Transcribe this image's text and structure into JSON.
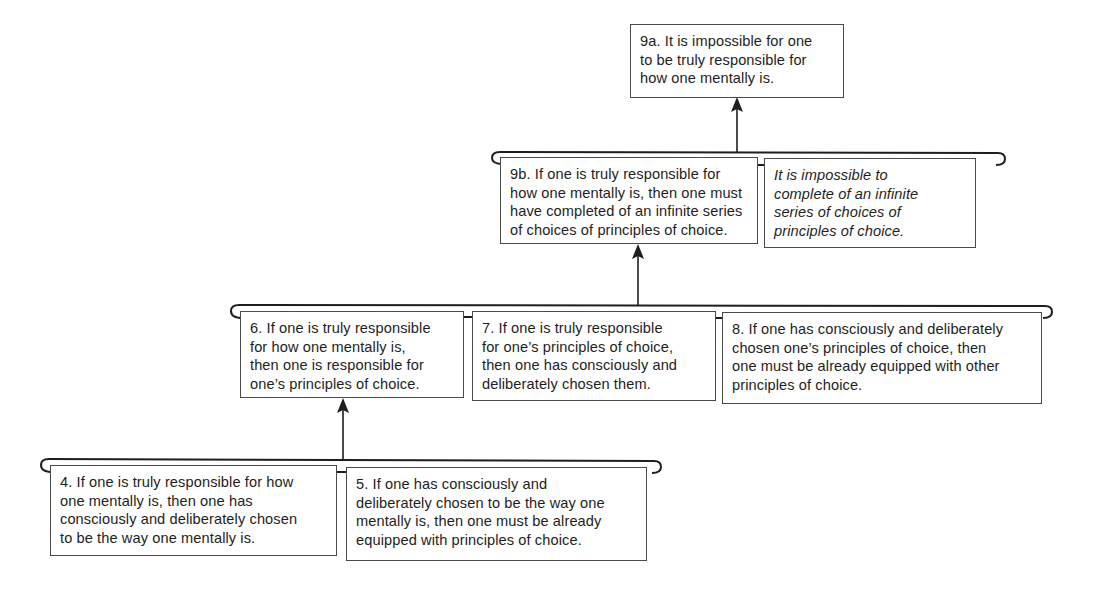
{
  "diagram": {
    "type": "argument-tree",
    "nodes": {
      "n9a": {
        "lines": [
          "9a. It is impossible for one",
          "to be truly responsible for",
          "how one mentally is."
        ]
      },
      "n9b": {
        "lines": [
          "9b. If one is truly responsible for",
          "how one mentally is, then one must",
          "have completed of an infinite series",
          "of choices of principles of choice."
        ]
      },
      "n9b_premise": {
        "lines": [
          "It is impossible to",
          "complete of an infinite",
          "series of choices of",
          "principles of choice."
        ],
        "style": "italic"
      },
      "n6": {
        "lines": [
          "6. If one is truly responsible",
          "for how one mentally is,",
          "then one is responsible for",
          "one’s principles of choice."
        ]
      },
      "n7": {
        "lines": [
          "7. If one is truly responsible",
          "for one’s principles of choice,",
          "then one has consciously and",
          "deliberately chosen them."
        ]
      },
      "n8": {
        "lines": [
          "8. If one has consciously and deliberately",
          "chosen one’s principles of choice, then",
          "one must be already equipped with other",
          "principles of choice."
        ]
      },
      "n4": {
        "lines": [
          "4. If one is truly responsible for how",
          "one mentally is, then one has",
          "consciously and deliberately chosen",
          "to be the way one mentally is."
        ]
      },
      "n5": {
        "lines": [
          "5. If one has consciously and",
          "deliberately chosen to be the way one",
          "mentally is, then one must be already",
          "equipped with principles of choice."
        ]
      }
    },
    "edges": [
      {
        "from_group": [
          "n9b",
          "n9b_premise"
        ],
        "to": "n9a"
      },
      {
        "from_group": [
          "n6",
          "n7",
          "n8"
        ],
        "to": "n9b"
      },
      {
        "from_group": [
          "n4",
          "n5"
        ],
        "to": "n6"
      }
    ],
    "colors": {
      "line": "#1e1e1e",
      "box_border": "#4a4a4a",
      "background": "#ffffff"
    }
  }
}
